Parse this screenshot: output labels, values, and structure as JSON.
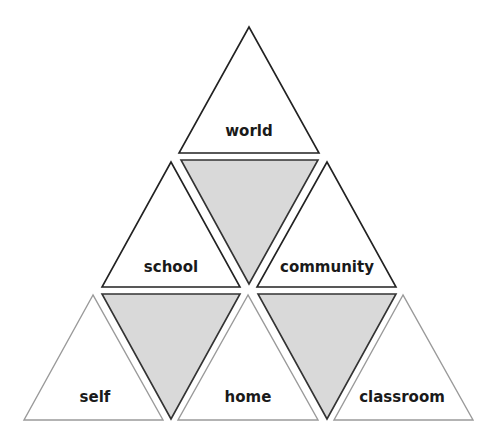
{
  "diagram": {
    "type": "triangle-pyramid",
    "colors": {
      "background": "#ffffff",
      "shaded_fill": "#d9d9d9",
      "stroke_dark": "#222222",
      "stroke_light": "#9a9a9a"
    },
    "triangles": [
      {
        "id": "world",
        "label": "world",
        "row": 1
      },
      {
        "id": "school",
        "label": "school",
        "row": 2
      },
      {
        "id": "community",
        "label": "community",
        "row": 2
      },
      {
        "id": "self",
        "label": "self",
        "row": 3
      },
      {
        "id": "home",
        "label": "home",
        "row": 3
      },
      {
        "id": "classroom",
        "label": "classroom",
        "row": 3
      }
    ],
    "shaded_inverted_triangles": 3
  }
}
